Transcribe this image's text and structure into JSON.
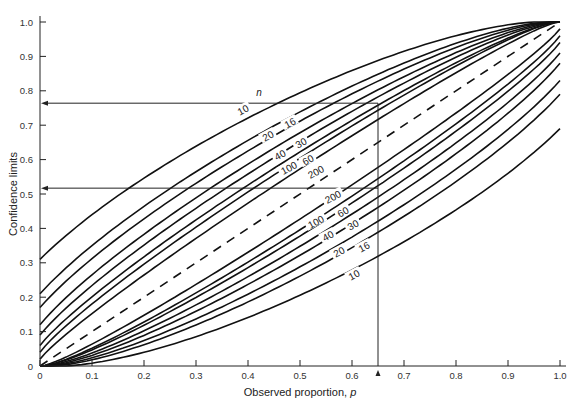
{
  "chart_data": {
    "type": "line",
    "title": "",
    "xlabel": "Observed proportion, p",
    "ylabel": "Confidence limits",
    "xlim": [
      0,
      1.0
    ],
    "ylim": [
      0,
      1.0
    ],
    "grid": false,
    "x_ticks": [
      "0",
      "0.1",
      "0.2",
      "0.3",
      "0.4",
      "0.5",
      "0.6",
      "0.7",
      "0.8",
      "0.9",
      "1.0"
    ],
    "y_ticks": [
      "0",
      "0.1",
      "0.2",
      "0.3",
      "0.4",
      "0.5",
      "0.6",
      "0.7",
      "0.8",
      "0.9",
      "1.0"
    ],
    "legend_header": "n",
    "series": [
      {
        "name": "10",
        "n": 10,
        "upper_at_p0": 0.31,
        "lower_at_p1": 0.69
      },
      {
        "name": "16",
        "n": 16,
        "upper_at_p0": 0.21,
        "lower_at_p1": 0.79
      },
      {
        "name": "20",
        "n": 20,
        "upper_at_p0": 0.17,
        "lower_at_p1": 0.83
      },
      {
        "name": "30",
        "n": 30,
        "upper_at_p0": 0.12,
        "lower_at_p1": 0.88
      },
      {
        "name": "40",
        "n": 40,
        "upper_at_p0": 0.09,
        "lower_at_p1": 0.91
      },
      {
        "name": "60",
        "n": 60,
        "upper_at_p0": 0.06,
        "lower_at_p1": 0.94
      },
      {
        "name": "100",
        "n": 100,
        "upper_at_p0": 0.04,
        "lower_at_p1": 0.96
      },
      {
        "name": "200",
        "n": 200,
        "upper_at_p0": 0.02,
        "lower_at_p1": 0.98
      }
    ],
    "reference_line": {
      "name": "p = confidence limit",
      "style": "dashed",
      "x": [
        0,
        1
      ],
      "y": [
        0,
        1
      ]
    },
    "annotations": [
      {
        "type": "vertical-line",
        "x": 0.65,
        "from_y": 0,
        "to_y": 0.764
      },
      {
        "type": "arrow-to-y-axis",
        "y": 0.764,
        "label": "upper limit for n=10 at p=0.65"
      },
      {
        "type": "arrow-to-y-axis",
        "y": 0.517,
        "label": "lower limit for n=10 at p=0.65"
      },
      {
        "type": "x-marker",
        "x": 0.65
      }
    ]
  }
}
